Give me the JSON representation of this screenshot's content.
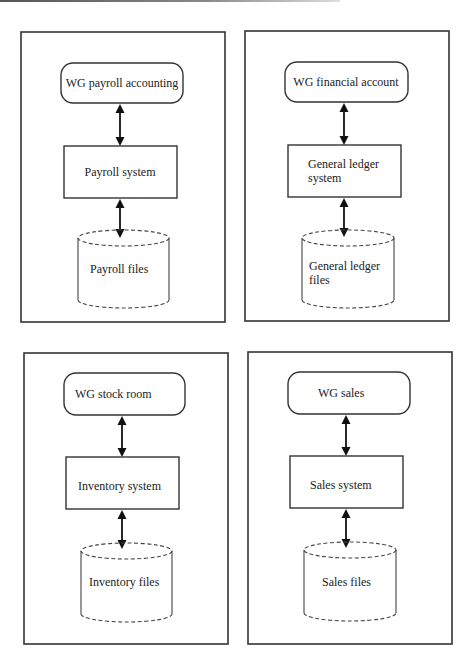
{
  "diagram": {
    "title": "",
    "panels": [
      {
        "id": "payroll",
        "actor": "WG payroll accounting",
        "system": [
          "Payroll  system"
        ],
        "files": [
          "Payroll files"
        ]
      },
      {
        "id": "financial",
        "actor": "WG financial account",
        "system": [
          "General ledger",
          "system"
        ],
        "files": [
          "General ledger",
          "files"
        ]
      },
      {
        "id": "inventory",
        "actor": "WG stock room",
        "system": [
          "Inventory system"
        ],
        "files": [
          "Inventory files"
        ]
      },
      {
        "id": "sales",
        "actor": "WG sales",
        "system": [
          "Sales system"
        ],
        "files": [
          "Sales files"
        ]
      }
    ],
    "edges": [
      {
        "from": "actor",
        "to": "system",
        "type": "bidirectional"
      },
      {
        "from": "system",
        "to": "files",
        "type": "bidirectional"
      }
    ],
    "colors": {
      "stroke": "#333333",
      "background": "#ffffff",
      "text": "#222222"
    }
  }
}
